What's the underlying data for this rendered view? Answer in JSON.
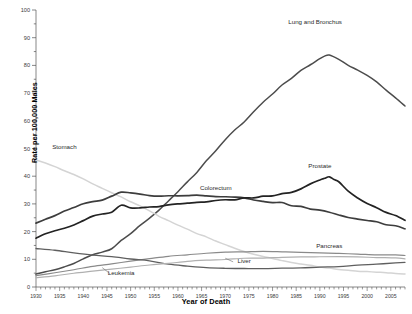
{
  "chart_data": {
    "type": "line",
    "title": "",
    "xlabel": "Year of Death",
    "ylabel": "Rate per 100,000 Males",
    "xlim": [
      1930,
      2008
    ],
    "ylim": [
      0,
      100
    ],
    "ytick_step": 10,
    "xtick_step": 5,
    "grid": false,
    "legend_position": "inline-annotations",
    "yticks": [
      "0",
      "10",
      "20",
      "30",
      "40",
      "50",
      "60",
      "70",
      "80",
      "90",
      "100"
    ],
    "xticks": [
      "1930",
      "1935",
      "1940",
      "1945",
      "1950",
      "1955",
      "1960",
      "1965",
      "1970",
      "1975",
      "1980",
      "1985",
      "1990",
      "1995",
      "2000",
      "2005"
    ],
    "series": [
      {
        "name": "Lung and Bronchus",
        "color": "#4c4c4c",
        "label_x": 1989,
        "label_y": 95,
        "x": [
          1930,
          1932,
          1934,
          1936,
          1938,
          1940,
          1942,
          1944,
          1946,
          1948,
          1950,
          1952,
          1954,
          1956,
          1958,
          1960,
          1962,
          1964,
          1966,
          1968,
          1970,
          1972,
          1974,
          1976,
          1978,
          1980,
          1982,
          1984,
          1986,
          1988,
          1990,
          1991,
          1992,
          1994,
          1996,
          1998,
          2000,
          2002,
          2004,
          2006,
          2008
        ],
        "values": [
          4.8,
          5.4,
          6.2,
          7.3,
          8.6,
          10.0,
          11.5,
          12.6,
          13.8,
          16.8,
          19.5,
          22.2,
          24.8,
          27.8,
          30.9,
          34.5,
          38.0,
          41.5,
          45.3,
          49.1,
          53.0,
          56.5,
          59.8,
          63.2,
          66.5,
          69.8,
          72.8,
          75.5,
          78.0,
          80.4,
          82.5,
          83.3,
          83.8,
          82.2,
          80.0,
          78.5,
          76.3,
          73.8,
          71.2,
          68.4,
          65.2
        ]
      },
      {
        "name": "Stomach",
        "color": "#d4d4d4",
        "label_x": 1936,
        "label_y": 50,
        "x": [
          1930,
          1932,
          1934,
          1936,
          1938,
          1940,
          1942,
          1944,
          1946,
          1948,
          1950,
          1952,
          1954,
          1956,
          1958,
          1960,
          1962,
          1964,
          1966,
          1968,
          1970,
          1972,
          1974,
          1976,
          1978,
          1980,
          1982,
          1984,
          1986,
          1988,
          1990,
          1992,
          1994,
          1996,
          1998,
          2000,
          2002,
          2004,
          2006,
          2008
        ],
        "values": [
          46.0,
          44.9,
          43.5,
          42.0,
          40.5,
          39.0,
          37.2,
          35.6,
          34.0,
          32.5,
          30.8,
          29.2,
          27.4,
          25.6,
          23.9,
          22.3,
          20.8,
          19.3,
          18.0,
          16.6,
          15.3,
          14.0,
          12.9,
          11.9,
          11.0,
          10.2,
          9.5,
          8.9,
          8.3,
          7.8,
          7.3,
          6.8,
          6.4,
          6.1,
          5.8,
          5.5,
          5.3,
          5.1,
          4.9,
          4.7
        ]
      },
      {
        "name": "Colorectum",
        "color": "#3d3d3d",
        "label_x": 1968,
        "label_y": 35,
        "x": [
          1930,
          1932,
          1934,
          1936,
          1938,
          1940,
          1942,
          1944,
          1946,
          1948,
          1950,
          1952,
          1954,
          1956,
          1958,
          1960,
          1962,
          1964,
          1966,
          1968,
          1970,
          1972,
          1974,
          1976,
          1978,
          1980,
          1982,
          1984,
          1986,
          1988,
          1990,
          1992,
          1994,
          1996,
          1998,
          2000,
          2002,
          2004,
          2006,
          2008
        ],
        "values": [
          23.2,
          24.5,
          25.9,
          27.2,
          28.6,
          29.8,
          30.7,
          31.6,
          32.6,
          34.5,
          34.1,
          33.4,
          32.9,
          33.0,
          33.2,
          33.1,
          33.0,
          33.2,
          33.1,
          32.9,
          32.8,
          32.4,
          32.0,
          31.6,
          31.1,
          30.7,
          30.2,
          29.6,
          28.9,
          28.2,
          27.6,
          26.8,
          26.0,
          25.3,
          24.6,
          23.9,
          23.3,
          22.7,
          22.0,
          21.1
        ]
      },
      {
        "name": "Prostate",
        "color": "#232323",
        "label_x": 1990,
        "label_y": 43,
        "x": [
          1930,
          1932,
          1934,
          1936,
          1938,
          1940,
          1942,
          1944,
          1946,
          1948,
          1950,
          1952,
          1954,
          1956,
          1958,
          1960,
          1962,
          1964,
          1966,
          1968,
          1970,
          1972,
          1974,
          1976,
          1978,
          1980,
          1982,
          1984,
          1986,
          1988,
          1990,
          1991,
          1992,
          1993,
          1994,
          1996,
          1998,
          2000,
          2002,
          2004,
          2006,
          2008
        ],
        "values": [
          17.8,
          19.0,
          20.3,
          21.5,
          22.6,
          24.1,
          25.3,
          26.4,
          27.3,
          29.5,
          28.5,
          28.4,
          28.8,
          29.3,
          29.7,
          30.1,
          30.4,
          30.6,
          30.8,
          31.0,
          31.3,
          31.5,
          31.9,
          32.2,
          32.6,
          32.9,
          33.4,
          34.2,
          35.4,
          37.2,
          38.8,
          39.3,
          39.5,
          39.1,
          37.8,
          34.5,
          32.0,
          30.3,
          28.6,
          27.1,
          25.6,
          24.1
        ]
      },
      {
        "name": "Pancreas",
        "color": "#8a8a8a",
        "label_x": 1992,
        "label_y": 14,
        "x": [
          1930,
          1934,
          1938,
          1942,
          1946,
          1950,
          1954,
          1958,
          1962,
          1966,
          1970,
          1974,
          1978,
          1982,
          1986,
          1990,
          1994,
          1998,
          2002,
          2006,
          2008
        ],
        "values": [
          4.2,
          5.2,
          6.3,
          7.4,
          8.4,
          9.4,
          10.2,
          11.0,
          11.6,
          12.1,
          12.5,
          12.7,
          12.8,
          12.7,
          12.5,
          12.3,
          12.1,
          11.9,
          11.7,
          11.5,
          11.3
        ]
      },
      {
        "name": "Liver",
        "color": "#5f5f5f",
        "label_x": 1974,
        "label_y": 8.5,
        "x": [
          1930,
          1934,
          1938,
          1942,
          1946,
          1950,
          1954,
          1958,
          1962,
          1966,
          1970,
          1974,
          1978,
          1982,
          1986,
          1990,
          1994,
          1998,
          2002,
          2006,
          2008
        ],
        "values": [
          13.8,
          13.2,
          12.4,
          11.6,
          10.9,
          10.2,
          9.5,
          8.3,
          7.5,
          7.0,
          6.7,
          6.6,
          6.6,
          6.7,
          6.9,
          7.1,
          7.4,
          7.8,
          8.2,
          8.6,
          8.9
        ]
      },
      {
        "name": "Leukemia",
        "color": "#b0b0b0",
        "label_x": 1948,
        "label_y": 4.2,
        "x": [
          1930,
          1934,
          1938,
          1942,
          1946,
          1950,
          1954,
          1958,
          1962,
          1966,
          1970,
          1974,
          1978,
          1982,
          1986,
          1990,
          1994,
          1998,
          2002,
          2006,
          2008
        ],
        "values": [
          3.4,
          4.1,
          4.9,
          5.7,
          6.4,
          7.2,
          7.9,
          8.6,
          9.2,
          9.6,
          10.0,
          10.3,
          10.5,
          10.7,
          10.8,
          10.9,
          10.9,
          10.8,
          10.6,
          10.4,
          10.2
        ]
      }
    ]
  },
  "axis": {
    "y_title": "Rate per 100,000 Males",
    "x_title": "Year of Death"
  }
}
